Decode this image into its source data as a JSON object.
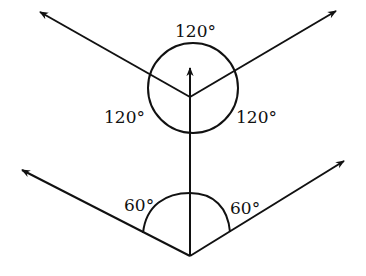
{
  "diagram": {
    "top_figure": {
      "description": "Three vectors from a common point separated by equal angles, with a circle around the vertex",
      "angles": [
        {
          "id": "top",
          "label": "120°"
        },
        {
          "id": "left",
          "label": "120°"
        },
        {
          "id": "right",
          "label": "120°"
        }
      ]
    },
    "bottom_figure": {
      "description": "Two vectors each making an angle with a vertical line, with a semicircular arc",
      "angles": [
        {
          "id": "left",
          "label": "60°"
        },
        {
          "id": "right",
          "label": "60°"
        }
      ]
    },
    "colors": {
      "stroke": "#111111",
      "background": "#ffffff"
    }
  }
}
